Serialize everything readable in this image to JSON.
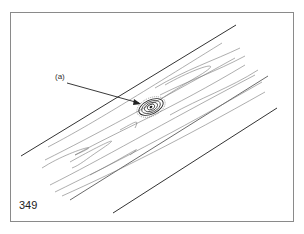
{
  "figure": {
    "number": "349",
    "callout_label": "(a)",
    "callout_target": "knot-icon",
    "colors": {
      "line": "#333333",
      "grain": "#666666",
      "frame": "#8a8a8a",
      "background": "#ffffff"
    }
  }
}
